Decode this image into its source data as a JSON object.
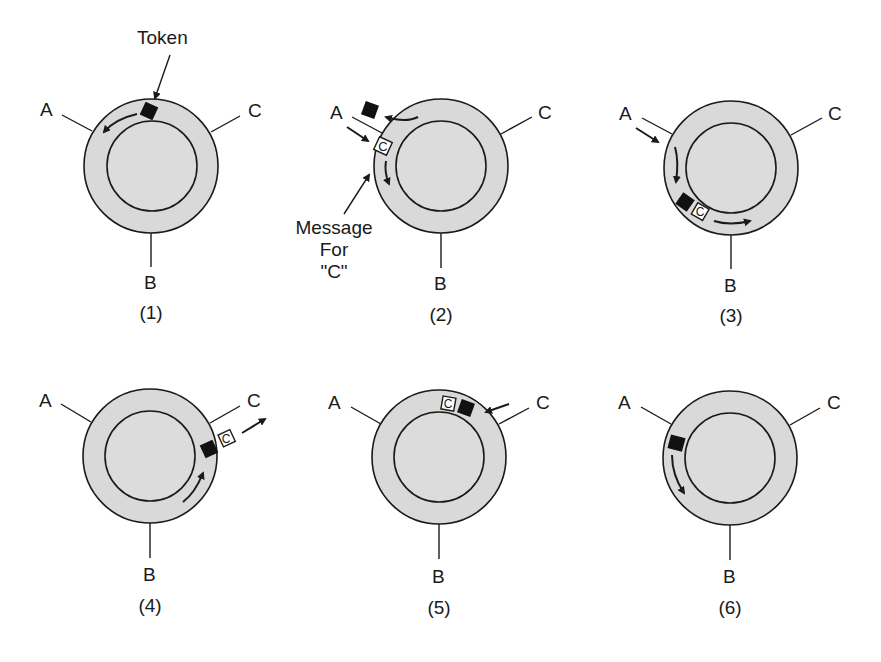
{
  "figure": {
    "colors": {
      "ring_fill": "#d9d9d9",
      "stroke": "#1a1a1a",
      "token": "#111111",
      "message_fill": "#ffffff",
      "background": "#ffffff"
    },
    "annotations": {
      "token_label": "Token",
      "message_label_lines": [
        "Message",
        "For",
        "\"C\""
      ]
    },
    "panels": [
      {
        "caption": "(1)",
        "stations": {
          "a": "A",
          "b": "B",
          "c": "C"
        },
        "token": "on ring at top, moving counter-clockwise toward A",
        "message": null
      },
      {
        "caption": "(2)",
        "stations": {
          "a": "A",
          "b": "B",
          "c": "C"
        },
        "token": "seized by A (off ring)",
        "message": "C"
      },
      {
        "caption": "(3)",
        "stations": {
          "a": "A",
          "b": "B",
          "c": "C"
        },
        "token": "follows message around ring",
        "message": "C"
      },
      {
        "caption": "(4)",
        "stations": {
          "a": "A",
          "b": "B",
          "c": "C"
        },
        "token": "at C; message copied out to C",
        "message": "C"
      },
      {
        "caption": "(5)",
        "stations": {
          "a": "A",
          "b": "B",
          "c": "C"
        },
        "token": "returns around ring toward A",
        "message": "C"
      },
      {
        "caption": "(6)",
        "stations": {
          "a": "A",
          "b": "B",
          "c": "C"
        },
        "token": "released by A, circulating again",
        "message": null
      }
    ]
  }
}
